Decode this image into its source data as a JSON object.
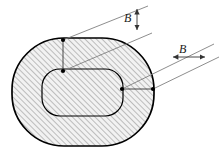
{
  "figure": {
    "background_color": "#ffffff",
    "outline_color": "#000000",
    "hatch_color": "#8a8a8a",
    "fill_color": "#eeeeee",
    "leader_color": "#777777",
    "dimension_color": "#333333",
    "marker_color": "#000000"
  },
  "shapes": {
    "outer": {
      "name": "outer-stadium-outline",
      "x": 12,
      "y": 38,
      "width": 142,
      "height": 108,
      "corner_radius": 52,
      "stroke_width": 1.6,
      "hatched": true
    },
    "inner": {
      "name": "inner-rounded-rect-outline",
      "x": 42,
      "y": 69,
      "width": 81,
      "height": 47,
      "corner_radius": 18,
      "stroke_width": 1.2,
      "hatched": true
    }
  },
  "callouts": [
    {
      "id": "b-top",
      "label": "B",
      "orientation": "vertical",
      "measures": "wall-thickness-top",
      "anchor_outer": {
        "x": 63,
        "y": 40
      },
      "anchor_inner": {
        "x": 63,
        "y": 71
      },
      "leader_upper": {
        "x1": 63,
        "y1": 40,
        "x2": 148,
        "y2": 6
      },
      "leader_lower": {
        "x1": 63,
        "y1": 71,
        "x2": 152,
        "y2": 33
      },
      "arrow": {
        "x": 137,
        "y1": 8,
        "y2": 31
      },
      "connector": {
        "x1": 63,
        "y1": 40,
        "x2": 63,
        "y2": 71
      }
    },
    {
      "id": "b-right",
      "label": "B",
      "orientation": "horizontal",
      "measures": "wall-thickness-right",
      "anchor_inner": {
        "x": 122,
        "y": 89
      },
      "anchor_outer": {
        "x": 153,
        "y": 89
      },
      "leader_upper": {
        "x1": 122,
        "y1": 89,
        "x2": 214,
        "y2": 44
      },
      "leader_lower": {
        "x1": 153,
        "y1": 89,
        "x2": 219,
        "y2": 57
      },
      "arrow": {
        "y": 57,
        "x1": 172,
        "x2": 206
      },
      "connector": {
        "x1": 122,
        "y1": 89,
        "x2": 153,
        "y2": 89
      }
    }
  ],
  "markers": [
    {
      "name": "marker-outer-top",
      "x": 63,
      "y": 40
    },
    {
      "name": "marker-inner-top",
      "x": 63,
      "y": 71
    },
    {
      "name": "marker-inner-right",
      "x": 122,
      "y": 89
    },
    {
      "name": "marker-outer-right",
      "x": 153,
      "y": 89
    }
  ]
}
